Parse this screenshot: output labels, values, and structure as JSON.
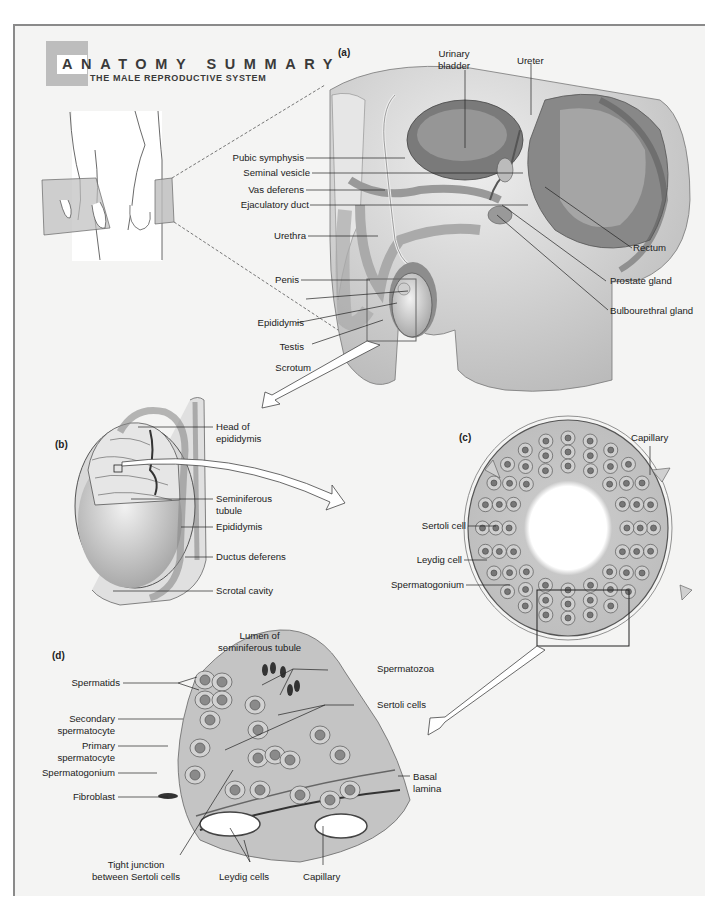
{
  "header": {
    "title": "ANATOMY SUMMARY",
    "subtitle": "THE MALE REPRODUCTIVE SYSTEM",
    "badge_color": "#bdbdbd"
  },
  "panels": {
    "a": {
      "tag": "(a)",
      "labels": {
        "urinary_bladder": "Urinary\nbladder",
        "ureter": "Ureter",
        "pubic_symphysis": "Pubic symphysis",
        "seminal_vesicle": "Seminal vesicle",
        "vas_deferens": "Vas deferens",
        "ejaculatory_duct": "Ejaculatory duct",
        "urethra": "Urethra",
        "penis": "Penis",
        "epididymis": "Epididymis",
        "testis": "Testis",
        "scrotum": "Scrotum",
        "rectum": "Rectum",
        "prostate_gland": "Prostate gland",
        "bulbourethral_gland": "Bulbourethral gland"
      }
    },
    "b": {
      "tag": "(b)",
      "labels": {
        "head_of_epididymis": "Head of\nepididymis",
        "seminiferous_tubule": "Seminiferous\ntubule",
        "epididymis": "Epididymis",
        "ductus_deferens": "Ductus deferens",
        "scrotal_cavity": "Scrotal cavity"
      }
    },
    "c": {
      "tag": "(c)",
      "labels": {
        "capillary": "Capillary",
        "sertoli_cell": "Sertoli cell",
        "leydig_cell": "Leydig cell",
        "spermatogonium": "Spermatogonium"
      }
    },
    "d": {
      "tag": "(d)",
      "labels": {
        "lumen": "Lumen of\nseminiferous tubule",
        "spermatozoa": "Spermatozoa",
        "sertoli_cells": "Sertoli cells",
        "spermatids": "Spermatids",
        "secondary_spermatocyte": "Secondary\nspermatocyte",
        "primary_spermatocyte": "Primary\nspermatocyte",
        "spermatogonium": "Spermatogonium",
        "fibroblast": "Fibroblast",
        "basal_lamina": "Basal\nlamina",
        "tight_junction": "Tight junction\nbetween Sertoli cells",
        "leydig_cells": "Leydig cells",
        "capillary": "Capillary"
      }
    }
  }
}
